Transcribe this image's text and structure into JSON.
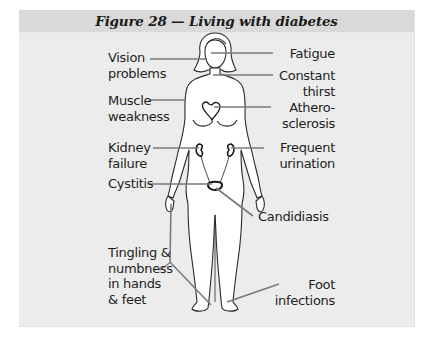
{
  "figure": {
    "title": "Figure 28 — Living with diabetes",
    "header_color": "#d9d9d9",
    "panel_color": "#ececec",
    "leader_line_color": "#7a7a7a"
  },
  "labels": {
    "left": [
      {
        "id": "vision",
        "line1": "Vision",
        "line2": "problems"
      },
      {
        "id": "muscle",
        "line1": "Muscle",
        "line2": "weakness"
      },
      {
        "id": "kidney",
        "line1": "Kidney",
        "line2": "failure"
      },
      {
        "id": "cystitis",
        "line1": "Cystitis",
        "line2": ""
      },
      {
        "id": "tingling",
        "line1": "Tingling &",
        "line2": "numbness",
        "line3": "in hands",
        "line4": "& feet"
      }
    ],
    "right": [
      {
        "id": "fatigue",
        "line1": "Fatigue",
        "line2": ""
      },
      {
        "id": "thirst",
        "line1": "Constant",
        "line2": "thirst"
      },
      {
        "id": "athero",
        "line1": "Athero-",
        "line2": "sclerosis"
      },
      {
        "id": "urination",
        "line1": "Frequent",
        "line2": "urination"
      },
      {
        "id": "candidiasis",
        "line1": "Candidiasis",
        "line2": ""
      },
      {
        "id": "foot",
        "line1": "Foot",
        "line2": "infections"
      }
    ]
  }
}
